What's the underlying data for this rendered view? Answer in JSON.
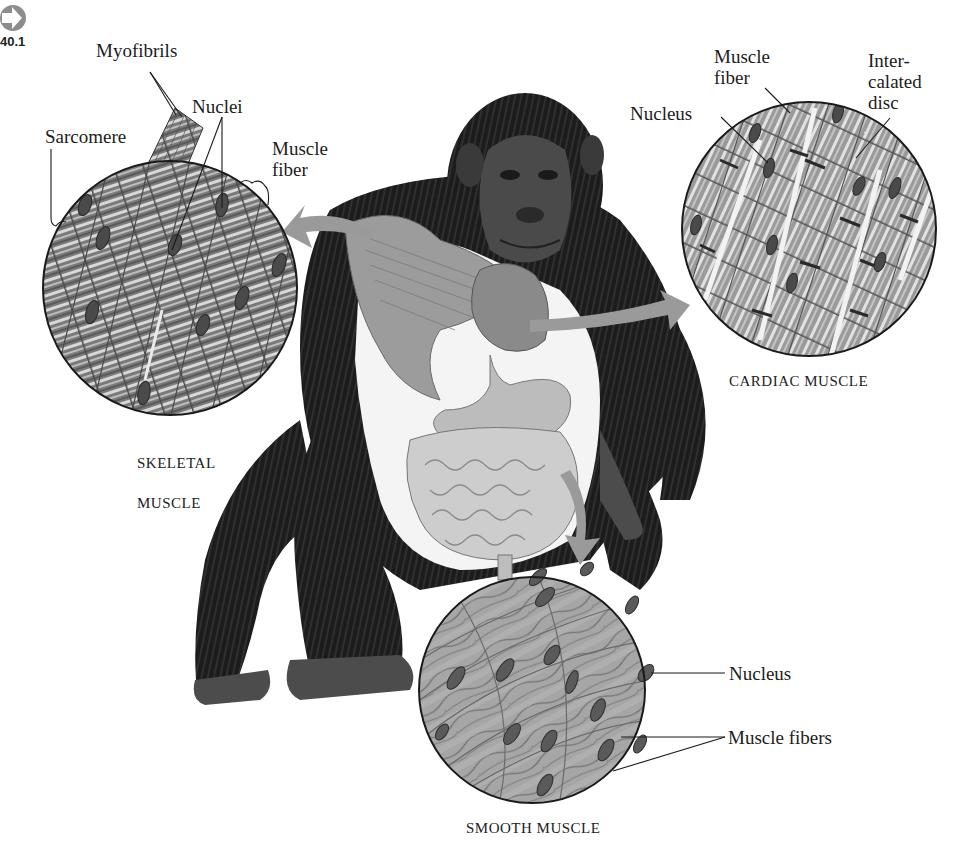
{
  "figure": {
    "ref_number": "40.1",
    "ref_icon": "arrow-right-circle-icon",
    "panels": {
      "skeletal": {
        "caption_line1": "Skeletal",
        "caption_line2": "muscle",
        "labels": {
          "myofibrils": "Myofibrils",
          "nuclei": "Nuclei",
          "sarcomere": "Sarcomere",
          "muscle_fiber": "Muscle\nfiber"
        }
      },
      "cardiac": {
        "caption": "Cardiac muscle",
        "labels": {
          "muscle_fiber": "Muscle\nfiber",
          "intercalated_disc": "Inter-\ncalated\ndisc",
          "nucleus": "Nucleus"
        }
      },
      "smooth": {
        "caption": "Smooth muscle",
        "labels": {
          "nucleus": "Nucleus",
          "muscle_fibers": "Muscle fibers"
        }
      }
    },
    "colors": {
      "arrow": "#9a9a9a",
      "fur": "#1e1e1e",
      "tissue_dark": "#6e6e6e",
      "tissue_light": "#c8c8c8",
      "nucleus": "#4a4a4a",
      "organ": "#b4b4b4"
    }
  }
}
